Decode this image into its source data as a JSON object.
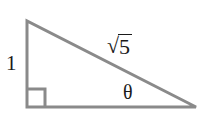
{
  "figure": {
    "kind": "right-triangle",
    "background_color": "#ffffff",
    "stroke_color": "#8a8a8a",
    "stroke_width": 3,
    "text_color": "#1a1a1a",
    "vertices": {
      "top_left": [
        27,
        21
      ],
      "bottom_left": [
        27,
        107
      ],
      "bottom_right": [
        196,
        107
      ]
    },
    "right_angle_marker": {
      "at": "bottom_left",
      "size": 18
    },
    "labels": {
      "vertical_leg": "1",
      "hypotenuse_radical_sign": "√",
      "hypotenuse_radicand": "5",
      "hypotenuse_full": "√5",
      "angle": "θ"
    }
  }
}
